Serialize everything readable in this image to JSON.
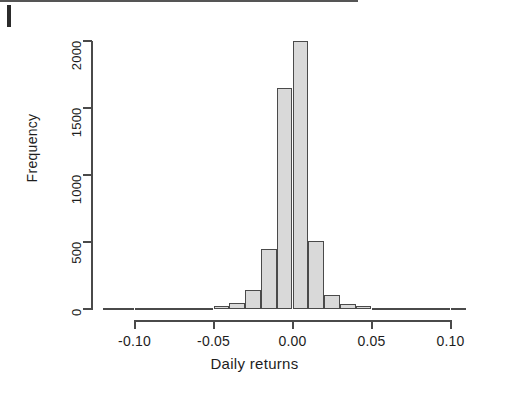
{
  "figure": {
    "scan_artifact": "left-edge-scan-mark"
  },
  "chart_data": {
    "type": "bar",
    "title": "",
    "subtitle": "",
    "xlabel": "Daily returns",
    "ylabel": "Frequency",
    "xlim": [
      -0.125,
      0.115
    ],
    "ylim": [
      0,
      2000
    ],
    "grid": false,
    "legend": null,
    "bin_width": 0.01,
    "x_tick_labels": [
      "-0.10",
      "-0.05",
      "0.00",
      "0.05",
      "0.10"
    ],
    "x_tick_values": [
      -0.1,
      -0.05,
      0.0,
      0.05,
      0.1
    ],
    "y_tick_labels": [
      "0",
      "500",
      "1000",
      "1500",
      "2000"
    ],
    "y_tick_values": [
      0,
      500,
      1000,
      1500,
      2000
    ],
    "bin_centers": [
      -0.115,
      -0.105,
      -0.095,
      -0.085,
      -0.075,
      -0.065,
      -0.055,
      -0.045,
      -0.035,
      -0.025,
      -0.015,
      -0.005,
      0.005,
      0.015,
      0.025,
      0.035,
      0.045,
      0.055,
      0.065,
      0.075,
      0.085,
      0.095,
      0.105
    ],
    "categories": [
      "-0.12",
      "-0.11",
      "-0.10",
      "-0.09",
      "-0.08",
      "-0.07",
      "-0.06",
      "-0.05",
      "-0.04",
      "-0.03",
      "-0.02",
      "-0.01",
      "0.00",
      "0.01",
      "0.02",
      "0.03",
      "0.04",
      "0.05",
      "0.06",
      "0.07",
      "0.08",
      "0.09",
      "0.10"
    ],
    "values": [
      1,
      1,
      2,
      2,
      3,
      4,
      6,
      20,
      45,
      140,
      450,
      1650,
      2000,
      510,
      105,
      35,
      20,
      8,
      4,
      2,
      2,
      1,
      1
    ]
  }
}
